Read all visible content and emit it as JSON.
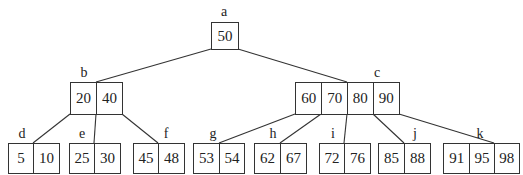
{
  "diagram": {
    "type": "B-tree",
    "nodes": [
      {
        "id": "a",
        "label": "a",
        "keys": [
          "50"
        ],
        "level": 0
      },
      {
        "id": "b",
        "label": "b",
        "keys": [
          "20",
          "40"
        ],
        "level": 1,
        "parent": "a"
      },
      {
        "id": "c",
        "label": "c",
        "keys": [
          "60",
          "70",
          "80",
          "90"
        ],
        "level": 1,
        "parent": "a"
      },
      {
        "id": "d",
        "label": "d",
        "keys": [
          "5",
          "10"
        ],
        "level": 2,
        "parent": "b"
      },
      {
        "id": "e",
        "label": "e",
        "keys": [
          "25",
          "30"
        ],
        "level": 2,
        "parent": "b"
      },
      {
        "id": "f",
        "label": "f",
        "keys": [
          "45",
          "48"
        ],
        "level": 2,
        "parent": "b"
      },
      {
        "id": "g",
        "label": "g",
        "keys": [
          "53",
          "54"
        ],
        "level": 2,
        "parent": "c"
      },
      {
        "id": "h",
        "label": "h",
        "keys": [
          "62",
          "67"
        ],
        "level": 2,
        "parent": "c"
      },
      {
        "id": "i",
        "label": "i",
        "keys": [
          "72",
          "76"
        ],
        "level": 2,
        "parent": "c"
      },
      {
        "id": "j",
        "label": "j",
        "keys": [
          "85",
          "88"
        ],
        "level": 2,
        "parent": "c"
      },
      {
        "id": "k",
        "label": "k",
        "keys": [
          "91",
          "95",
          "98"
        ],
        "level": 2,
        "parent": "c"
      }
    ]
  }
}
